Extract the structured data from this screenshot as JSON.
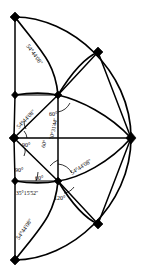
{
  "figure": {
    "name": "spherical-triangle-subdivision-diagram",
    "width": 141,
    "height": 278,
    "stroke_color": "#000000",
    "background_color": "#ffffff"
  },
  "labels": {
    "upper_left_arc": "54°44'08''",
    "upper_inner_left": "54°44'08''",
    "upper_inner_60": "60°",
    "center_90_upper": "90°",
    "inner_70": "70°31'44''",
    "inner_60_vertical": "60°",
    "left_90": "90°",
    "lower_60": "60°",
    "lower_35": "35°15'52''",
    "lower_120": "120°",
    "lower_left_arc": "54°44'08''",
    "right_arc": "54°44'08''"
  },
  "nodes": [
    {
      "name": "node-top-left",
      "x": 15,
      "y": 17
    },
    {
      "name": "node-mid-left-upper",
      "x": 15,
      "y": 95
    },
    {
      "name": "node-center-left",
      "x": 14,
      "y": 138
    },
    {
      "name": "node-mid-left-lower",
      "x": 15,
      "y": 181
    },
    {
      "name": "node-bottom-left",
      "x": 15,
      "y": 260
    },
    {
      "name": "node-inner-upper",
      "x": 58,
      "y": 95
    },
    {
      "name": "node-inner-lower",
      "x": 58,
      "y": 181
    },
    {
      "name": "node-arc-upper-right",
      "x": 98,
      "y": 52
    },
    {
      "name": "node-arc-lower-right",
      "x": 98,
      "y": 224
    },
    {
      "name": "node-right",
      "x": 131,
      "y": 138
    }
  ],
  "angles": {
    "units": "degrees-minutes-seconds",
    "values": [
      {
        "label": "54°44'08''",
        "count": 4
      },
      {
        "label": "60°",
        "count": 3
      },
      {
        "label": "90°",
        "count": 2
      },
      {
        "label": "70°31'44''",
        "count": 1
      },
      {
        "label": "35°15'52''",
        "count": 1
      },
      {
        "label": "120°",
        "count": 1
      }
    ]
  }
}
